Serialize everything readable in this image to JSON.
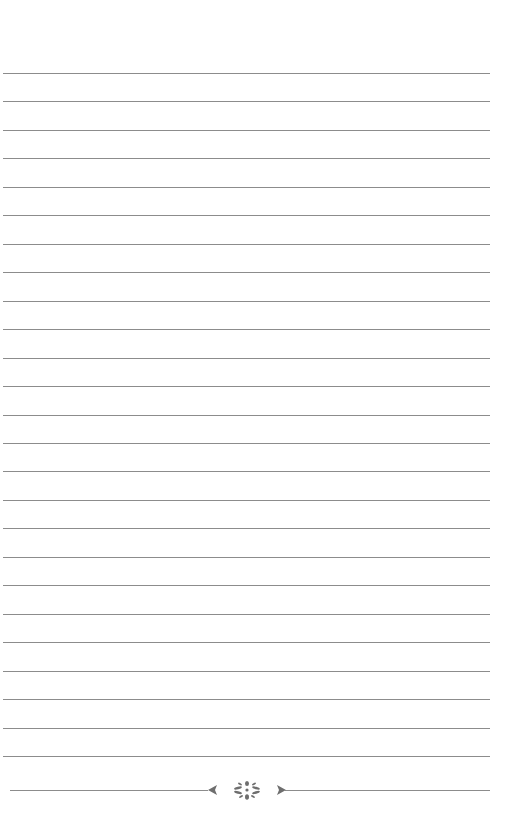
{
  "page": {
    "type": "lined-notepaper",
    "background_color": "#ffffff",
    "rule_color": "#8c8c8c",
    "rule_count": 25,
    "first_rule_y": 73,
    "rule_spacing": 28.46,
    "rule_left": 3,
    "rule_width": 487
  },
  "footer": {
    "rule_y": 790,
    "ornament_icon": "floral-divider-icon",
    "ornament_color": "#6e6e6e"
  }
}
